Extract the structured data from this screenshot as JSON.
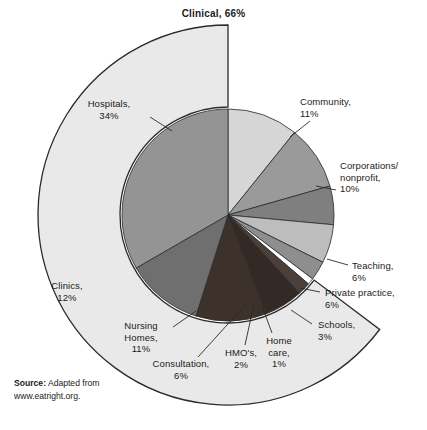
{
  "title": "Clinical, 66%",
  "source": {
    "label": "Source:",
    "text": " Adapted from",
    "url": "www.eatright.org."
  },
  "colors": {
    "outer_ring": "#e9e9e9",
    "hospitals": "#949494",
    "community": "#d6d6d6",
    "corporations": "#9a9a9a",
    "teaching": "#7f7f7f",
    "private_practice": "#bdbdbd",
    "schools": "#8e8e8e",
    "home_care": "#ffffff",
    "hmos": "#4a4039",
    "consultation": "#342a25",
    "nursing_homes": "#3c312b",
    "clinics": "#6f6f6f",
    "outline": "#2a2a2a",
    "background": "#ffffff"
  },
  "labels": {
    "hospitals": "Hospitals,\n34%",
    "community": "Community,\n11%",
    "corporations": "Corporations/\nnonprofit,\n10%",
    "teaching": "Teaching,\n6%",
    "private_practice": "Private practice,\n6%",
    "schools": "Schools,\n3%",
    "home_care": "Home\ncare,\n1%",
    "hmos": "HMO's,\n2%",
    "consultation": "Consultation,\n6%",
    "nursing_homes": "Nursing\nHomes,\n11%",
    "clinics": "Clinics,\n12%"
  },
  "chart_data": {
    "type": "pie",
    "title": "Clinical, 66%",
    "subtitle": "",
    "xlabel": "",
    "ylabel": "",
    "units": "percent",
    "start_angle_deg": 0,
    "direction": "clockwise",
    "legend": "none",
    "labels_placement": "callout",
    "categories": [
      "Community",
      "Corporations/nonprofit",
      "Teaching",
      "Private practice",
      "Schools",
      "Home care",
      "HMO's",
      "Consultation",
      "Nursing Homes",
      "Clinics",
      "Hospitals"
    ],
    "values": [
      11,
      10,
      6,
      6,
      3,
      1,
      2,
      6,
      11,
      12,
      34
    ],
    "slices": [
      {
        "label": "Community",
        "value": 11,
        "color": "#d6d6d6",
        "group": "Community"
      },
      {
        "label": "Corporations/nonprofit",
        "value": 10,
        "color": "#9a9a9a",
        "group": "Community"
      },
      {
        "label": "Teaching",
        "value": 6,
        "color": "#7f7f7f",
        "group": "Other"
      },
      {
        "label": "Private practice",
        "value": 6,
        "color": "#bdbdbd",
        "group": "Other"
      },
      {
        "label": "Schools",
        "value": 3,
        "color": "#8e8e8e",
        "group": "Other"
      },
      {
        "label": "Home care",
        "value": 1,
        "color": "#ffffff",
        "group": "Clinical"
      },
      {
        "label": "HMO's",
        "value": 2,
        "color": "#4a4039",
        "group": "Clinical"
      },
      {
        "label": "Consultation",
        "value": 6,
        "color": "#342a25",
        "group": "Clinical"
      },
      {
        "label": "Nursing Homes",
        "value": 11,
        "color": "#3c312b",
        "group": "Clinical"
      },
      {
        "label": "Clinics",
        "value": 12,
        "color": "#6f6f6f",
        "group": "Clinical"
      },
      {
        "label": "Hospitals",
        "value": 34,
        "color": "#949494",
        "group": "Clinical"
      }
    ],
    "groups": [
      {
        "label": "Clinical",
        "value": 66,
        "members": [
          "Hospitals",
          "Clinics",
          "Nursing Homes",
          "Consultation",
          "HMO's",
          "Home care"
        ]
      }
    ],
    "total": 102,
    "annotations": [
      "Clinical, 66%",
      "Source: Adapted from www.eatright.org."
    ]
  }
}
